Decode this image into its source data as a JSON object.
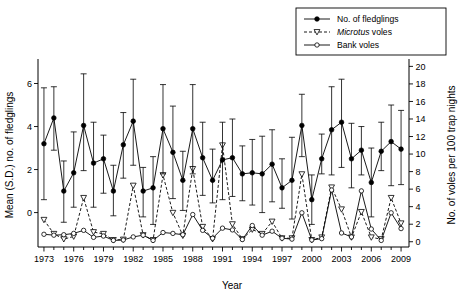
{
  "chart_data": {
    "type": "line",
    "title": "",
    "xlabel": "Year",
    "ylabel": "Mean (S.D.) no. of fledglings",
    "y2label": "No. of voles per 100 trap nights",
    "xlim": [
      1972.4,
      2009.8
    ],
    "ylim": [
      -1.6,
      7.0
    ],
    "y2lim": [
      -0.6,
      20.5
    ],
    "grid": false,
    "legend_position": "top-right",
    "xticks_major": [
      1973,
      1976,
      1979,
      1982,
      1985,
      1988,
      1991,
      1994,
      1997,
      2000,
      2003,
      2006,
      2009
    ],
    "xticks_minor_all_years": true,
    "yticks": [
      0,
      2,
      4,
      6
    ],
    "y2ticks": [
      0,
      2,
      4,
      6,
      8,
      10,
      12,
      14,
      16,
      18,
      20
    ],
    "x": [
      1973,
      1974,
      1975,
      1976,
      1977,
      1978,
      1979,
      1980,
      1981,
      1982,
      1983,
      1984,
      1985,
      1986,
      1987,
      1988,
      1989,
      1990,
      1991,
      1992,
      1993,
      1994,
      1995,
      1996,
      1997,
      1998,
      1999,
      2000,
      2001,
      2002,
      2003,
      2004,
      2005,
      2006,
      2007,
      2008,
      2009
    ],
    "series": [
      {
        "name": "No. of fledglings",
        "axis": "left",
        "marker": "filled-circle",
        "line": "solid",
        "values": [
          3.2,
          4.4,
          1.0,
          1.85,
          4.05,
          2.3,
          2.5,
          1.0,
          3.15,
          4.25,
          1.0,
          1.15,
          3.9,
          2.8,
          1.5,
          3.9,
          2.55,
          1.5,
          2.45,
          2.55,
          1.8,
          1.85,
          1.8,
          2.25,
          1.15,
          1.5,
          4.05,
          0.6,
          2.5,
          3.85,
          4.2,
          2.5,
          2.9,
          1.4,
          2.85,
          3.3,
          2.95
        ],
        "sd_upper": [
          5.8,
          5.85,
          2.4,
          3.75,
          6.45,
          4.2,
          3.6,
          2.2,
          4.65,
          6.2,
          2.1,
          2.6,
          5.95,
          4.95,
          2.85,
          5.95,
          4.2,
          2.95,
          4.2,
          4.35,
          3.1,
          3.4,
          3.55,
          3.85,
          2.5,
          3.5,
          5.5,
          1.75,
          3.65,
          5.85,
          6.2,
          4.15,
          4.0,
          3.0,
          4.2,
          5.0,
          4.75
        ],
        "sd_lower": [
          0.6,
          2.9,
          -0.45,
          0.25,
          1.95,
          0.25,
          0.9,
          -0.15,
          1.6,
          2.2,
          -0.2,
          -0.55,
          1.8,
          0.65,
          0.1,
          1.8,
          0.8,
          0.45,
          0.6,
          0.75,
          0.55,
          0.35,
          0.0,
          0.5,
          0.2,
          -0.3,
          2.6,
          -0.55,
          1.8,
          1.75,
          2.1,
          1.15,
          1.75,
          -0.2,
          1.95,
          1.25,
          1.3
        ]
      },
      {
        "name": "Microtus voles",
        "axis": "right",
        "marker": "open-triangle-down",
        "line": "dashed",
        "values": [
          2.5,
          0.9,
          0.3,
          0.6,
          5.0,
          1.1,
          0.9,
          0.2,
          0.25,
          6.4,
          0.75,
          0.2,
          7.6,
          3.3,
          0.7,
          8.3,
          1.7,
          0.3,
          11.0,
          2.0,
          0.3,
          1.4,
          0.9,
          2.3,
          0.4,
          0.4,
          7.7,
          0.2,
          0.5,
          6.2,
          3.7,
          0.5,
          3.4,
          0.5,
          0.3,
          5.0,
          2.1
        ]
      },
      {
        "name": "Bank voles",
        "axis": "right",
        "marker": "open-circle",
        "line": "solid",
        "values": [
          0.85,
          0.75,
          0.8,
          0.95,
          1.3,
          0.5,
          0.65,
          0.15,
          0.2,
          0.55,
          0.75,
          0.15,
          1.05,
          0.95,
          0.8,
          3.1,
          1.3,
          0.4,
          1.55,
          1.35,
          0.25,
          1.85,
          0.75,
          1.2,
          0.4,
          0.3,
          3.3,
          0.2,
          0.35,
          5.9,
          1.0,
          0.55,
          5.8,
          1.45,
          0.15,
          3.3,
          1.5
        ]
      }
    ],
    "legend": [
      {
        "label": "No. of fledglings",
        "marker": "filled-circle",
        "line": "solid",
        "italic_first_word": false
      },
      {
        "label": "Microtus voles",
        "marker": "open-triangle-down",
        "line": "dashed",
        "italic_first_word": true,
        "italic_word": "Microtus",
        "rest": " voles"
      },
      {
        "label": "Bank voles",
        "marker": "open-circle",
        "line": "solid",
        "italic_first_word": false
      }
    ],
    "colors": {
      "ink": "#000000",
      "background": "#ffffff"
    }
  }
}
